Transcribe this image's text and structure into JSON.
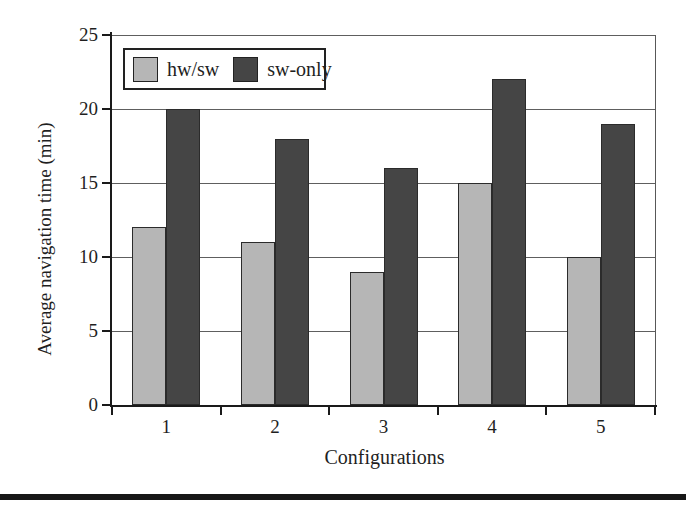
{
  "chart_data": {
    "type": "bar",
    "title": "",
    "categories": [
      "1",
      "2",
      "3",
      "4",
      "5"
    ],
    "series": [
      {
        "name": "hw/sw",
        "color": "#b6b6b6",
        "values": [
          12,
          11,
          9,
          15,
          10
        ]
      },
      {
        "name": "sw-only",
        "color": "#454545",
        "values": [
          20,
          18,
          16,
          22,
          19
        ]
      }
    ],
    "xlabel": "Configurations",
    "ylabel": "Average navigation time (min)",
    "ylim": [
      0,
      25
    ],
    "yticks": [
      0,
      5,
      10,
      15,
      20,
      25
    ],
    "grid": true,
    "legend_position": "top-left-inside",
    "bar_border_color": "#2b2b2b"
  },
  "colors": {
    "axis": "#1a1a1a",
    "gridline": "#5e5e5e",
    "text": "#1f1f1f",
    "bottom_rule": "#171717",
    "background": "#ffffff"
  }
}
